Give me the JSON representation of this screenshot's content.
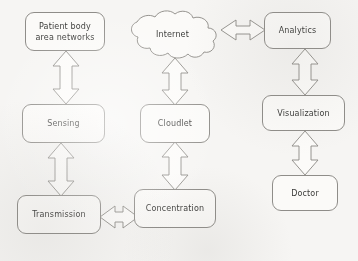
{
  "diagram": {
    "type": "block-diagram",
    "background_color": "#f6f5f3",
    "node_fill_color": "#fbfaf8",
    "stroke_color": "#8f8d89",
    "text_color": "#3a3a38",
    "nodes": [
      {
        "id": "patient-body-area-networks",
        "label": "Patient body\narea networks",
        "shape": "rounded-rect",
        "x": 25,
        "y": 12,
        "w": 80,
        "h": 39,
        "column": "left",
        "row": 1
      },
      {
        "id": "internet",
        "label": "Internet",
        "shape": "cloud",
        "x": 124,
        "y": 8,
        "w": 97,
        "h": 54,
        "column": "center",
        "row": 1
      },
      {
        "id": "analytics",
        "label": "Analytics",
        "shape": "rounded-rect",
        "x": 264,
        "y": 12,
        "w": 67,
        "h": 37,
        "column": "right",
        "row": 1
      },
      {
        "id": "sensing",
        "label": "Sensing",
        "shape": "rounded-rect",
        "x": 22,
        "y": 104,
        "w": 83,
        "h": 39,
        "column": "left",
        "row": 2
      },
      {
        "id": "cloudlet",
        "label": "Cloudlet",
        "shape": "rounded-rect",
        "x": 140,
        "y": 104,
        "w": 70,
        "h": 39,
        "column": "center",
        "row": 2
      },
      {
        "id": "visualization",
        "label": "Visualization",
        "shape": "rounded-rect",
        "x": 262,
        "y": 95,
        "w": 83,
        "h": 36,
        "column": "right",
        "row": 2
      },
      {
        "id": "transmission",
        "label": "Transmission",
        "shape": "rounded-rect",
        "x": 17,
        "y": 195,
        "w": 84,
        "h": 39,
        "column": "left",
        "row": 3
      },
      {
        "id": "concentration",
        "label": "Concentration",
        "shape": "rounded-rect",
        "x": 134,
        "y": 189,
        "w": 82,
        "h": 39,
        "column": "center",
        "row": 3
      },
      {
        "id": "doctor",
        "label": "Doctor",
        "shape": "rounded-rect",
        "x": 272,
        "y": 175,
        "w": 66,
        "h": 36,
        "column": "right",
        "row": 3
      }
    ],
    "connectors": [
      {
        "id": "patient-to-sensing",
        "from": "patient-body-area-networks",
        "to": "sensing",
        "orientation": "vertical",
        "style": "double-headed-block-arrow"
      },
      {
        "id": "sensing-to-transmission",
        "from": "sensing",
        "to": "transmission",
        "orientation": "vertical",
        "style": "double-headed-block-arrow"
      },
      {
        "id": "internet-to-cloudlet",
        "from": "internet",
        "to": "cloudlet",
        "orientation": "vertical",
        "style": "double-headed-block-arrow"
      },
      {
        "id": "cloudlet-to-concentration",
        "from": "cloudlet",
        "to": "concentration",
        "orientation": "vertical",
        "style": "double-headed-block-arrow"
      },
      {
        "id": "transmission-to-concentration",
        "from": "transmission",
        "to": "concentration",
        "orientation": "horizontal",
        "style": "double-headed-block-arrow"
      },
      {
        "id": "internet-to-analytics",
        "from": "internet",
        "to": "analytics",
        "orientation": "horizontal",
        "style": "double-headed-block-arrow"
      },
      {
        "id": "analytics-to-visualization",
        "from": "analytics",
        "to": "visualization",
        "orientation": "vertical",
        "style": "double-headed-block-arrow"
      },
      {
        "id": "visualization-to-doctor",
        "from": "visualization",
        "to": "doctor",
        "orientation": "vertical",
        "style": "double-headed-block-arrow"
      }
    ]
  }
}
